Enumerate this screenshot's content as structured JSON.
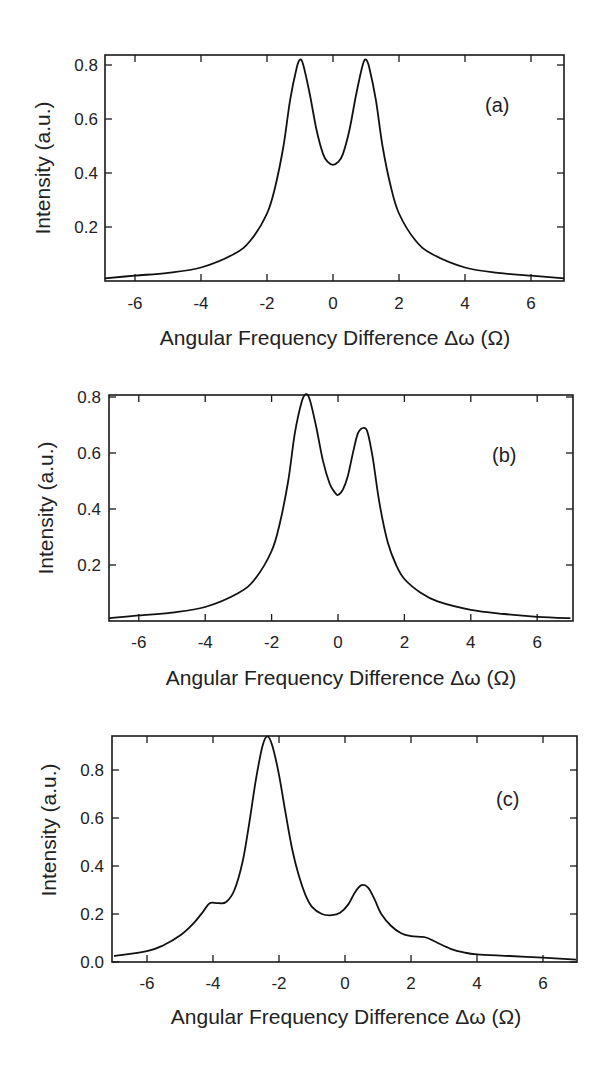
{
  "figure": {
    "panels": [
      {
        "id": "a",
        "tag": "(a)",
        "ylabel": "Intensity (a.u.)",
        "xlabel": "Angular Frequency Difference Δω (Ω)",
        "xticks": [
          "-6",
          "-4",
          "-2",
          "0",
          "2",
          "4",
          "6"
        ],
        "yticks": [
          "0.2",
          "0.4",
          "0.6",
          "0.8"
        ]
      },
      {
        "id": "b",
        "tag": "(b)",
        "ylabel": "Intensity (a.u.)",
        "xlabel": "Angular Frequency Difference Δω (Ω)",
        "xticks": [
          "-6",
          "-4",
          "-2",
          "0",
          "2",
          "4",
          "6"
        ],
        "yticks": [
          "0.2",
          "0.4",
          "0.6",
          "0.8"
        ]
      },
      {
        "id": "c",
        "tag": "(c)",
        "ylabel": "Intensity (a.u.)",
        "xlabel": "Angular Frequency Difference Δω (Ω)",
        "xticks": [
          "-6",
          "-4",
          "-2",
          "0",
          "2",
          "4",
          "6"
        ],
        "yticks": [
          "0.0",
          "0.2",
          "0.4",
          "0.6",
          "0.8"
        ]
      }
    ]
  },
  "chart_data": [
    {
      "type": "line",
      "title": "(a)",
      "xlabel": "Angular Frequency Difference Δω (Ω)",
      "ylabel": "Intensity (a.u.)",
      "xlim": [
        -7.2,
        7.0
      ],
      "ylim": [
        0,
        0.83
      ],
      "xticks": [
        -6,
        -4,
        -2,
        0,
        2,
        4,
        6
      ],
      "yticks": [
        0.2,
        0.4,
        0.6,
        0.8
      ],
      "grid": false,
      "legend": null,
      "series": [
        {
          "name": "spectrum (a)",
          "x": [
            -7.2,
            -6,
            -5,
            -4,
            -3,
            -2.5,
            -2,
            -1.75,
            -1.5,
            -1.3,
            -1.1,
            -1.0,
            -0.9,
            -0.7,
            -0.5,
            -0.3,
            -0.15,
            0,
            0.15,
            0.3,
            0.5,
            0.7,
            0.9,
            1.0,
            1.1,
            1.3,
            1.5,
            1.75,
            2,
            2.5,
            3,
            4,
            5,
            6,
            7.0
          ],
          "y": [
            0.01,
            0.02,
            0.03,
            0.05,
            0.1,
            0.15,
            0.25,
            0.35,
            0.5,
            0.67,
            0.79,
            0.82,
            0.8,
            0.69,
            0.56,
            0.47,
            0.44,
            0.43,
            0.44,
            0.47,
            0.56,
            0.69,
            0.8,
            0.82,
            0.79,
            0.67,
            0.5,
            0.35,
            0.25,
            0.15,
            0.1,
            0.05,
            0.03,
            0.02,
            0.01
          ]
        }
      ]
    },
    {
      "type": "line",
      "title": "(b)",
      "xlabel": "Angular Frequency Difference Δω (Ω)",
      "ylabel": "Intensity (a.u.)",
      "xlim": [
        -7.2,
        7.0
      ],
      "ylim": [
        0,
        0.82
      ],
      "xticks": [
        -6,
        -4,
        -2,
        0,
        2,
        4,
        6
      ],
      "yticks": [
        0.2,
        0.4,
        0.6,
        0.8
      ],
      "grid": false,
      "legend": null,
      "series": [
        {
          "name": "spectrum (b)",
          "x": [
            -7.2,
            -6,
            -5,
            -4,
            -3,
            -2.5,
            -2,
            -1.75,
            -1.5,
            -1.3,
            -1.1,
            -0.97,
            -0.85,
            -0.65,
            -0.45,
            -0.25,
            -0.1,
            0,
            0.15,
            0.3,
            0.45,
            0.6,
            0.78,
            0.9,
            1.05,
            1.25,
            1.5,
            1.75,
            2,
            2.5,
            3,
            4,
            5,
            6,
            7.0
          ],
          "y": [
            0.01,
            0.02,
            0.03,
            0.05,
            0.1,
            0.15,
            0.25,
            0.35,
            0.5,
            0.67,
            0.78,
            0.81,
            0.79,
            0.69,
            0.57,
            0.49,
            0.46,
            0.45,
            0.47,
            0.52,
            0.6,
            0.67,
            0.69,
            0.67,
            0.58,
            0.42,
            0.28,
            0.2,
            0.15,
            0.1,
            0.07,
            0.04,
            0.025,
            0.015,
            0.01
          ]
        }
      ]
    },
    {
      "type": "line",
      "title": "(c)",
      "xlabel": "Angular Frequency Difference Δω (Ω)",
      "ylabel": "Intensity (a.u.)",
      "xlim": [
        -7.0,
        7.0
      ],
      "ylim": [
        0.0,
        0.95
      ],
      "xticks": [
        -6,
        -4,
        -2,
        0,
        2,
        4,
        6
      ],
      "yticks": [
        0.0,
        0.2,
        0.4,
        0.6,
        0.8
      ],
      "grid": false,
      "legend": null,
      "series": [
        {
          "name": "spectrum (c)",
          "x": [
            -7.0,
            -6,
            -5.5,
            -5,
            -4.6,
            -4.3,
            -4.1,
            -3.85,
            -3.6,
            -3.35,
            -3.1,
            -2.9,
            -2.7,
            -2.5,
            -2.35,
            -2.2,
            -2.0,
            -1.8,
            -1.6,
            -1.4,
            -1.2,
            -1.0,
            -0.7,
            -0.4,
            -0.15,
            0.1,
            0.3,
            0.5,
            0.7,
            0.9,
            1.1,
            1.4,
            1.7,
            2.0,
            2.3,
            2.5,
            2.8,
            3.2,
            3.6,
            4.0,
            5,
            6,
            7.0
          ],
          "y": [
            0.025,
            0.045,
            0.07,
            0.11,
            0.16,
            0.21,
            0.245,
            0.245,
            0.25,
            0.3,
            0.42,
            0.58,
            0.76,
            0.9,
            0.94,
            0.9,
            0.78,
            0.62,
            0.47,
            0.36,
            0.28,
            0.23,
            0.2,
            0.195,
            0.205,
            0.24,
            0.29,
            0.32,
            0.31,
            0.26,
            0.2,
            0.15,
            0.12,
            0.108,
            0.105,
            0.1,
            0.08,
            0.055,
            0.04,
            0.032,
            0.025,
            0.018,
            0.01
          ]
        }
      ]
    }
  ]
}
